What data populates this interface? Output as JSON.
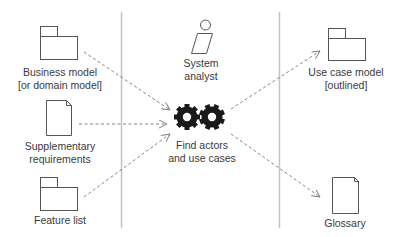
{
  "diagram": {
    "lanes": [
      {
        "id": "inputs"
      },
      {
        "id": "activity"
      },
      {
        "id": "outputs"
      }
    ],
    "inputs": [
      {
        "id": "business-model",
        "type": "package",
        "line1": "Business model",
        "line2": "[or domain model]"
      },
      {
        "id": "supplementary-requirements",
        "type": "document",
        "line1": "Supplementary",
        "line2": "requirements"
      },
      {
        "id": "feature-list",
        "type": "package",
        "line1": "Feature list",
        "line2": ""
      }
    ],
    "worker": {
      "id": "system-analyst",
      "type": "worker",
      "line1": "System",
      "line2": "analyst"
    },
    "activity": {
      "id": "find-actors-and-use-cases",
      "type": "activity-gears",
      "line1": "Find actors",
      "line2": "and use cases"
    },
    "outputs": [
      {
        "id": "use-case-model",
        "type": "package",
        "line1": "Use case model",
        "line2": "[outlined]"
      },
      {
        "id": "glossary",
        "type": "document",
        "line1": "Glossary",
        "line2": ""
      }
    ],
    "flows": [
      {
        "from": "business-model",
        "to": "find-actors-and-use-cases",
        "style": "dashed-open-arrow"
      },
      {
        "from": "supplementary-requirements",
        "to": "find-actors-and-use-cases",
        "style": "dashed-open-arrow"
      },
      {
        "from": "feature-list",
        "to": "find-actors-and-use-cases",
        "style": "dashed-open-arrow"
      },
      {
        "from": "find-actors-and-use-cases",
        "to": "use-case-model",
        "style": "dashed-open-arrow"
      },
      {
        "from": "find-actors-and-use-cases",
        "to": "glossary",
        "style": "dashed-open-arrow"
      }
    ],
    "colors": {
      "stroke": "#555555",
      "lane_divider": "#bbbbbb",
      "gear": "#1a1a1a",
      "text": "#3a3a3a",
      "arrow": "#777777"
    }
  }
}
